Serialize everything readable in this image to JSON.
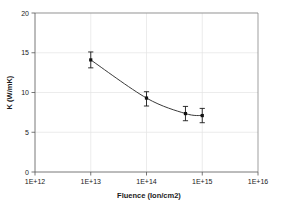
{
  "chart_data": {
    "type": "scatter",
    "title": "",
    "xlabel": "Fluence (Ion/cm2)",
    "ylabel": "K (W/mK)",
    "xscale": "log",
    "yscale": "linear",
    "xlim": [
      1000000000000.0,
      1e+16
    ],
    "ylim": [
      0,
      20
    ],
    "xticks": [
      1000000000000.0,
      10000000000000.0,
      100000000000000.0,
      1000000000000000.0,
      1e+16
    ],
    "xtick_labels": [
      "1E+12",
      "1E+13",
      "1E+14",
      "1E+15",
      "1E+16"
    ],
    "yticks": [
      0,
      5,
      10,
      15,
      20
    ],
    "ytick_labels": [
      "0",
      "5",
      "10",
      "15",
      "20"
    ],
    "grid": true,
    "legend": false,
    "marker": "square",
    "series": [
      {
        "name": "K vs Fluence",
        "x": [
          10000000000000.0,
          100000000000000.0,
          500000000000000.0,
          1000000000000000.0
        ],
        "y": [
          14.1,
          9.3,
          7.35,
          7.1
        ],
        "yerr_low": [
          1.0,
          1.0,
          0.9,
          0.9
        ],
        "yerr_high": [
          1.0,
          0.8,
          0.9,
          0.9
        ]
      }
    ]
  }
}
